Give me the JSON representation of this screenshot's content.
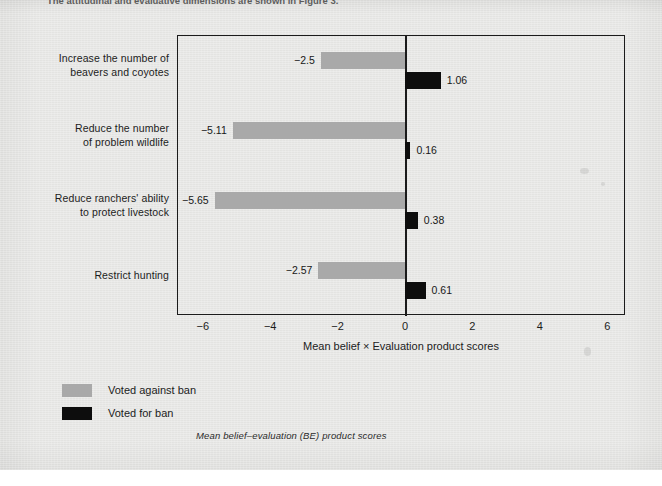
{
  "figure": {
    "top_cut_caption": "The attitudinal and evaluative dimensions are shown in Figure 3.",
    "caption": "Mean belief–evaluation (BE) product scores",
    "x_axis_title": "Mean belief × Evaluation product scores"
  },
  "colors": {
    "voted_against_ban": "#a9a9a9",
    "voted_for_ban": "#0d0d0d",
    "axis": "#1b1b1b",
    "paper": "#e9e9e7"
  },
  "legend": {
    "position": "below-axis-left",
    "items": [
      {
        "label": "Voted against ban",
        "swatch": "voted_against_ban"
      },
      {
        "label": "Voted for ban",
        "swatch": "voted_for_ban"
      }
    ]
  },
  "chart_data": {
    "type": "bar",
    "orientation": "horizontal",
    "title": "",
    "xlabel": "Mean belief × Evaluation product scores",
    "ylabel": "",
    "xlim": [
      -7.0,
      6.6
    ],
    "xticks": [
      -6,
      -4,
      -2,
      0,
      2,
      4,
      6
    ],
    "xtick_labels": [
      "−6",
      "−4",
      "−2",
      "0",
      "2",
      "4",
      "6"
    ],
    "grid": false,
    "zero_line": true,
    "categories": [
      "Increase the number of beavers and coyotes",
      "Reduce the number of problem wildlife",
      "Reduce ranchers' ability to protect livestock",
      "Restrict hunting"
    ],
    "category_lines": [
      [
        "Increase the number of",
        "beavers and coyotes"
      ],
      [
        "Reduce the number",
        "of problem wildlife"
      ],
      [
        "Reduce ranchers' ability",
        "to protect livestock"
      ],
      [
        "Restrict hunting"
      ]
    ],
    "series": [
      {
        "name": "Voted against ban",
        "color": "#a9a9a9",
        "values": [
          -2.5,
          -5.11,
          -5.65,
          -2.57
        ],
        "value_labels": [
          "−2.5",
          "−5.11",
          "−5.65",
          "−2.57"
        ]
      },
      {
        "name": "Voted for ban",
        "color": "#0d0d0d",
        "values": [
          1.06,
          0.16,
          0.38,
          0.61
        ],
        "value_labels": [
          "1.06",
          "0.16",
          "0.38",
          "0.61"
        ]
      }
    ]
  }
}
